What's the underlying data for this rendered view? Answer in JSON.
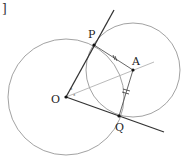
{
  "figure": {
    "corner_mark": "]",
    "points": {
      "O": {
        "label": "O",
        "x": 66,
        "y": 97
      },
      "P": {
        "label": "P",
        "x": 94,
        "y": 45
      },
      "A": {
        "label": "A",
        "x": 133,
        "y": 70
      },
      "Q": {
        "label": "Q",
        "x": 119,
        "y": 116
      }
    },
    "angle_mark": "°",
    "colors": {
      "circle": "#8a8a8a",
      "bold_line": "#333333",
      "thin_line": "#a8a8a8",
      "point": "#111111"
    }
  }
}
